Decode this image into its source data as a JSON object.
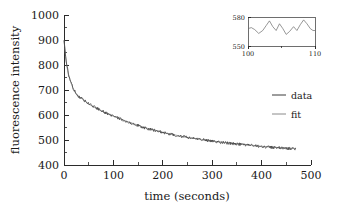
{
  "chart_data": {
    "type": "line",
    "title": "",
    "xlabel": "time (seconds)",
    "ylabel": "fluorescence intensity",
    "xlim": [
      0,
      500
    ],
    "ylim": [
      400,
      1000
    ],
    "xticks": [
      0,
      100,
      200,
      300,
      400,
      500
    ],
    "yticks": [
      400,
      500,
      600,
      700,
      800,
      900,
      1000
    ],
    "xtick_labels": [
      "0",
      "100",
      "200",
      "300",
      "400",
      "500"
    ],
    "ytick_labels": [
      "400",
      "500",
      "600",
      "700",
      "800",
      "900",
      "1000"
    ],
    "minor_ticks": true,
    "grid": false,
    "legend_position": "right",
    "series": [
      {
        "name": "data",
        "color": "#3a3a3a",
        "description": "noisy exponential decay of fluorescence intensity",
        "x": [
          0,
          2,
          4,
          6,
          8,
          10,
          14,
          18,
          22,
          26,
          30,
          36,
          42,
          48,
          54,
          60,
          70,
          80,
          90,
          100,
          110,
          120,
          130,
          140,
          150,
          160,
          170,
          180,
          190,
          200,
          215,
          230,
          245,
          260,
          275,
          290,
          305,
          320,
          335,
          350,
          365,
          380,
          395,
          410,
          425,
          440,
          455,
          470
        ],
        "y": [
          900,
          862,
          820,
          795,
          775,
          757,
          730,
          710,
          695,
          683,
          672,
          668,
          657,
          648,
          640,
          633,
          623,
          613,
          604,
          596,
          588,
          580,
          572,
          565,
          558,
          551,
          545,
          540,
          535,
          530,
          523,
          517,
          512,
          507,
          503,
          498,
          494,
          490,
          487,
          484,
          481,
          478,
          475,
          472,
          470,
          468,
          466,
          465
        ]
      },
      {
        "name": "fit",
        "color": "#8a8a8a",
        "description": "smooth biexponential fit to the data",
        "x": [
          0,
          2,
          4,
          6,
          8,
          10,
          14,
          18,
          22,
          26,
          30,
          36,
          42,
          48,
          54,
          60,
          70,
          80,
          90,
          100,
          110,
          120,
          130,
          140,
          150,
          160,
          170,
          180,
          190,
          200,
          215,
          230,
          245,
          260,
          275,
          290,
          305,
          320,
          335,
          350,
          365,
          380,
          395,
          410,
          425,
          440,
          455,
          470
        ],
        "y": [
          898,
          860,
          822,
          793,
          773,
          756,
          729,
          709,
          694,
          682,
          673,
          666,
          656,
          647,
          639,
          632,
          622,
          612,
          603,
          595,
          587,
          580,
          573,
          566,
          559,
          552,
          546,
          541,
          536,
          531,
          524,
          518,
          512,
          508,
          503,
          499,
          495,
          491,
          488,
          485,
          482,
          479,
          476,
          473,
          471,
          469,
          467,
          466
        ]
      }
    ],
    "inset": {
      "xlabel": "",
      "ylabel": "",
      "xlim": [
        100,
        110
      ],
      "ylim": [
        550,
        580
      ],
      "xticks": [
        100,
        110
      ],
      "yticks": [
        550,
        580
      ],
      "xtick_labels": [
        "100",
        "110"
      ],
      "ytick_labels": [
        "550",
        "580"
      ],
      "description": "zoomed view of data noise between 100 and 110 seconds",
      "x": [
        100.0,
        100.5,
        101.0,
        101.6,
        102.2,
        102.7,
        103.2,
        103.7,
        104.2,
        104.7,
        105.2,
        105.7,
        106.2,
        106.8,
        107.3,
        107.8,
        108.3,
        108.8,
        109.3,
        109.7,
        110.0
      ],
      "y": [
        568,
        569,
        567,
        563,
        566,
        571,
        576,
        570,
        566,
        573,
        568,
        562,
        565,
        570,
        566,
        572,
        577,
        573,
        568,
        566,
        566
      ]
    },
    "legend": [
      {
        "label": "data",
        "color": "#3a3a3a"
      },
      {
        "label": "fit",
        "color": "#8a8a8a"
      }
    ]
  },
  "figure": {
    "xlabel": "time (seconds)",
    "ylabel": "fluorescence intensity"
  }
}
